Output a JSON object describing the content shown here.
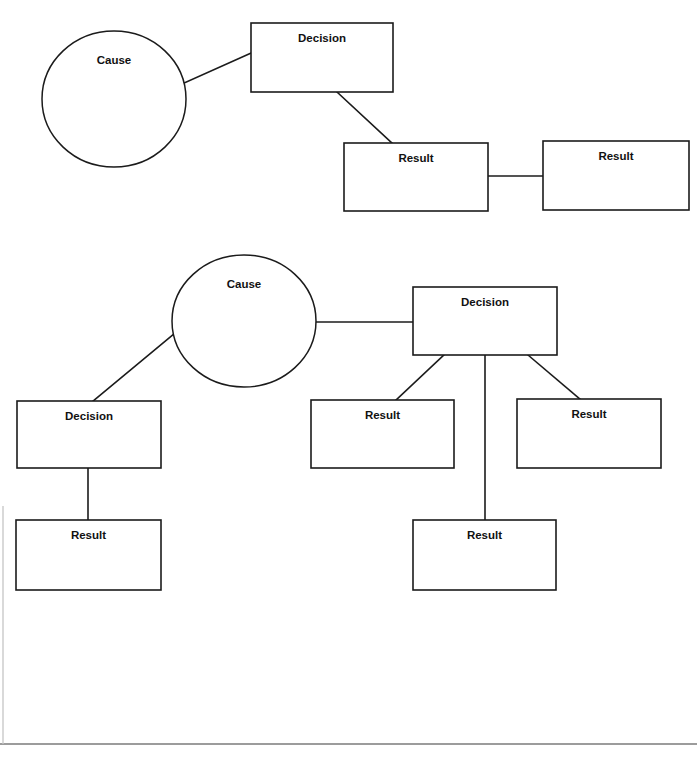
{
  "page": {
    "background_color": "#ffffff",
    "ink_color": "#1b1b1b",
    "width": 697,
    "height": 757
  },
  "diagrams": [
    {
      "id": "diagram-top",
      "name": "upper-cause-effect-diagram",
      "nodes": [
        {
          "id": "top-cause",
          "label": "Cause",
          "shape": "ellipse",
          "cx": 114,
          "cy": 99,
          "rx": 72,
          "ry": 68
        },
        {
          "id": "top-decision",
          "label": "Decision",
          "shape": "rectangle",
          "x": 251,
          "y": 23,
          "w": 142,
          "h": 69
        },
        {
          "id": "top-result-1",
          "label": "Result",
          "shape": "rectangle",
          "x": 344,
          "y": 143,
          "w": 144,
          "h": 68
        },
        {
          "id": "top-result-2",
          "label": "Result",
          "shape": "rectangle",
          "x": 543,
          "y": 141,
          "w": 146,
          "h": 69
        }
      ],
      "edges": [
        {
          "id": "top-edge-1",
          "from": "top-cause",
          "to": "top-decision",
          "x1": 182,
          "y1": 84,
          "x2": 251,
          "y2": 53
        },
        {
          "id": "top-edge-2",
          "from": "top-decision",
          "to": "top-result-1",
          "x1": 337,
          "y1": 92,
          "x2": 392,
          "y2": 143
        },
        {
          "id": "top-edge-3",
          "from": "top-result-1",
          "to": "top-result-2",
          "x1": 488,
          "y1": 176,
          "x2": 543,
          "y2": 176
        }
      ]
    },
    {
      "id": "diagram-bottom",
      "name": "lower-cause-effect-diagram",
      "nodes": [
        {
          "id": "bot-cause",
          "label": "Cause",
          "shape": "ellipse",
          "cx": 244,
          "cy": 321,
          "rx": 72,
          "ry": 66
        },
        {
          "id": "bot-decision-r",
          "label": "Decision",
          "shape": "rectangle",
          "x": 413,
          "y": 287,
          "w": 144,
          "h": 68
        },
        {
          "id": "bot-decision-l",
          "label": "Decision",
          "shape": "rectangle",
          "x": 17,
          "y": 401,
          "w": 144,
          "h": 67
        },
        {
          "id": "bot-result-mid",
          "label": "Result",
          "shape": "rectangle",
          "x": 311,
          "y": 400,
          "w": 143,
          "h": 68
        },
        {
          "id": "bot-result-rt",
          "label": "Result",
          "shape": "rectangle",
          "x": 517,
          "y": 399,
          "w": 144,
          "h": 69
        },
        {
          "id": "bot-result-left",
          "label": "Result",
          "shape": "rectangle",
          "x": 16,
          "y": 520,
          "w": 145,
          "h": 70
        },
        {
          "id": "bot-result-btm",
          "label": "Result",
          "shape": "rectangle",
          "x": 413,
          "y": 520,
          "w": 143,
          "h": 70
        }
      ],
      "edges": [
        {
          "id": "bot-edge-1",
          "from": "bot-cause",
          "to": "bot-decision-r",
          "x1": 314,
          "y1": 322,
          "x2": 413,
          "y2": 322
        },
        {
          "id": "bot-edge-2",
          "from": "bot-cause",
          "to": "bot-decision-l",
          "x1": 174,
          "y1": 334,
          "x2": 93,
          "y2": 401
        },
        {
          "id": "bot-edge-3",
          "from": "bot-decision-l",
          "to": "bot-result-left",
          "x1": 88,
          "y1": 468,
          "x2": 88,
          "y2": 520
        },
        {
          "id": "bot-edge-4",
          "from": "bot-decision-r",
          "to": "bot-result-mid",
          "x1": 444,
          "y1": 355,
          "x2": 396,
          "y2": 400
        },
        {
          "id": "bot-edge-5",
          "from": "bot-decision-r",
          "to": "bot-result-btm",
          "x1": 485,
          "y1": 355,
          "x2": 485,
          "y2": 520
        },
        {
          "id": "bot-edge-6",
          "from": "bot-decision-r",
          "to": "bot-result-rt",
          "x1": 528,
          "y1": 355,
          "x2": 580,
          "y2": 399
        }
      ]
    }
  ],
  "page_marks": {
    "bottom_rule": {
      "x1": 0,
      "y1": 744,
      "x2": 697,
      "y2": 744
    },
    "left_margin_rule": {
      "x1": 3,
      "y1": 506,
      "x2": 3,
      "y2": 744
    }
  }
}
